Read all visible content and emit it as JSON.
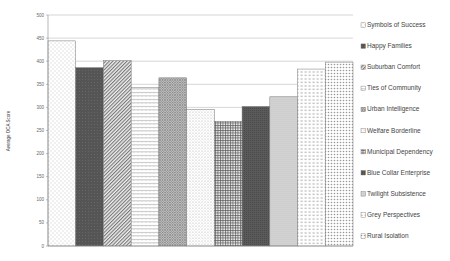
{
  "chart_data": {
    "type": "bar",
    "title": "",
    "xlabel": "",
    "ylabel": "Average OCA Score",
    "ylim": [
      0,
      500
    ],
    "yticks": [
      0,
      50,
      100,
      150,
      200,
      250,
      300,
      350,
      400,
      450,
      500
    ],
    "grid": "horizontal",
    "legend_position": "right",
    "categories": [
      "Symbols of Success",
      "Happy Families",
      "Suburban Comfort",
      "Ties of Community",
      "Urban Intelligence",
      "Welfare Borderline",
      "Municipal Dependency",
      "Blue Collar Enterprise",
      "Twilight Subsistence",
      "Grey Perspectives",
      "Rural Isolation"
    ],
    "values": [
      444,
      386,
      401,
      343,
      364,
      296,
      270,
      302,
      323,
      383,
      398
    ],
    "patterns": [
      "dots-sparse",
      "solid-dark",
      "diagonal",
      "zigzag",
      "crosshatch-diag",
      "dots-fine",
      "grid",
      "solid-dark2",
      "dots-dense",
      "dashes",
      "dots-large"
    ]
  },
  "legend": {
    "items": [
      "Symbols of Success",
      "Happy Families",
      "Suburban Comfort",
      "Ties of Community",
      "Urban Intelligence",
      "Welfare Borderline",
      "Municipal Dependency",
      "Blue Collar Enterprise",
      "Twilight Subsistence",
      "Grey Perspectives",
      "Rural Isolation"
    ]
  },
  "axis": {
    "y_label": "Average OCA Score",
    "ticks": [
      "0",
      "50",
      "100",
      "150",
      "200",
      "250",
      "300",
      "350",
      "400",
      "450",
      "500"
    ]
  }
}
